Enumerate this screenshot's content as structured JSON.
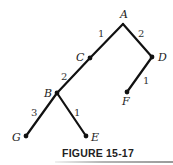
{
  "diagram": {
    "type": "weighted-tree",
    "nodes": [
      {
        "id": "A",
        "label": "A",
        "x": 123,
        "y": 24,
        "lx": 120,
        "ly": 18,
        "dot": false
      },
      {
        "id": "C",
        "label": "C",
        "x": 90,
        "y": 58,
        "lx": 76,
        "ly": 61,
        "dot": true
      },
      {
        "id": "D",
        "label": "D",
        "x": 152,
        "y": 57,
        "lx": 158,
        "ly": 61,
        "dot": true
      },
      {
        "id": "B",
        "label": "B",
        "x": 57,
        "y": 93,
        "lx": 44,
        "ly": 97,
        "dot": true
      },
      {
        "id": "F",
        "label": "F",
        "x": 127,
        "y": 92,
        "lx": 122,
        "ly": 105,
        "dot": true
      },
      {
        "id": "G",
        "label": "G",
        "x": 26,
        "y": 136,
        "lx": 12,
        "ly": 141,
        "dot": true
      },
      {
        "id": "E",
        "label": "E",
        "x": 86,
        "y": 136,
        "lx": 91,
        "ly": 141,
        "dot": true
      }
    ],
    "edges": [
      {
        "from": "A",
        "to": "C",
        "weight": "1",
        "wx": 98,
        "wy": 37
      },
      {
        "from": "A",
        "to": "D",
        "weight": "2",
        "wx": 138,
        "wy": 37
      },
      {
        "from": "C",
        "to": "B",
        "weight": "2",
        "wx": 61,
        "wy": 80
      },
      {
        "from": "D",
        "to": "F",
        "weight": "1",
        "wx": 143,
        "wy": 84
      },
      {
        "from": "B",
        "to": "G",
        "weight": "3",
        "wx": 31,
        "wy": 116
      },
      {
        "from": "B",
        "to": "E",
        "weight": "1",
        "wx": 74,
        "wy": 116
      }
    ]
  },
  "caption": "FIGURE 15-17"
}
